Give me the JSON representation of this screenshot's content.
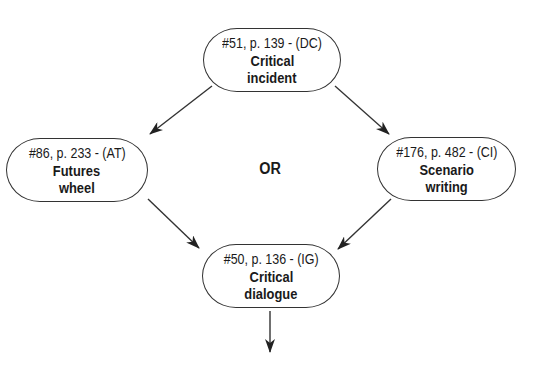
{
  "diagram": {
    "nodes": [
      {
        "id": "top",
        "ref": "#51, p. 139 - (DC)",
        "title_line1": "Critical",
        "title_line2": "incident"
      },
      {
        "id": "left",
        "ref": "#86, p. 233 - (AT)",
        "title_line1": "Futures",
        "title_line2": "wheel"
      },
      {
        "id": "right",
        "ref": "#176, p. 482 - (CI)",
        "title_line1": "Scenario",
        "title_line2": "writing"
      },
      {
        "id": "bottom",
        "ref": "#50, p. 136 - (IG)",
        "title_line1": "Critical",
        "title_line2": "dialogue"
      }
    ],
    "connector_label": "OR",
    "edges": [
      {
        "from": "top",
        "to": "left"
      },
      {
        "from": "top",
        "to": "right"
      },
      {
        "from": "left",
        "to": "bottom"
      },
      {
        "from": "right",
        "to": "bottom"
      },
      {
        "from": "bottom",
        "to": "next"
      }
    ],
    "colors": {
      "stroke": "#333333",
      "text": "#1a1a1a",
      "background": "#ffffff"
    }
  }
}
